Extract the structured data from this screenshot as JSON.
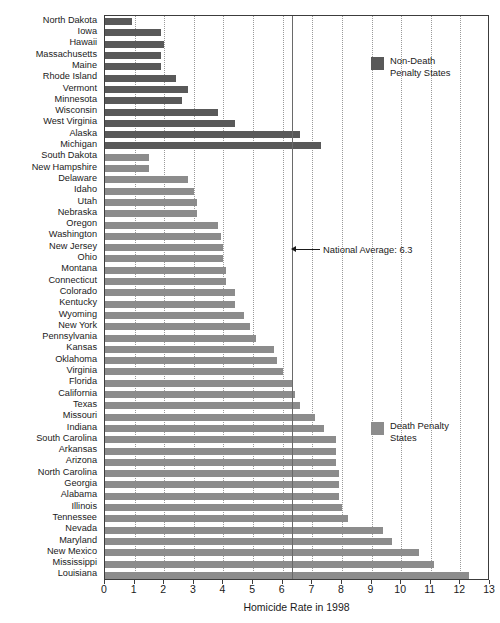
{
  "chart_data": {
    "type": "bar",
    "orientation": "horizontal",
    "title": "",
    "xlabel": "Homicide Rate in 1998",
    "ylabel": "",
    "xlim": [
      0,
      13
    ],
    "xticks": [
      0,
      1,
      2,
      3,
      4,
      5,
      6,
      7,
      8,
      9,
      10,
      11,
      12,
      13
    ],
    "xtick_labels": [
      "0",
      "1",
      "2",
      "3",
      "4",
      "5",
      "6",
      "7",
      "8",
      "9",
      "10",
      "11",
      "12",
      "13"
    ],
    "grid": "vertical-dotted",
    "legend_position": "inside-right",
    "series": [
      {
        "name": "Non-Death Penalty States",
        "color": "#595959"
      },
      {
        "name": "Death Penalty States",
        "color": "#8c8c8c"
      }
    ],
    "annotations": [
      {
        "label": "National Average: 6.3",
        "value": 6.3,
        "style": "vertical-line-with-left-arrow"
      }
    ],
    "categories": [
      "North Dakota",
      "Iowa",
      "Hawaii",
      "Massachusetts",
      "Maine",
      "Rhode Island",
      "Vermont",
      "Minnesota",
      "Wisconsin",
      "West Virginia",
      "Alaska",
      "Michigan",
      "South Dakota",
      "New Hampshire",
      "Delaware",
      "Idaho",
      "Utah",
      "Nebraska",
      "Oregon",
      "Washington",
      "New Jersey",
      "Ohio",
      "Montana",
      "Connecticut",
      "Colorado",
      "Kentucky",
      "Wyoming",
      "New York",
      "Pennsylvania",
      "Kansas",
      "Oklahoma",
      "Virginia",
      "Florida",
      "California",
      "Texas",
      "Missouri",
      "Indiana",
      "South Carolina",
      "Arkansas",
      "Arizona",
      "North Carolina",
      "Georgia",
      "Alabama",
      "Illinois",
      "Tennessee",
      "Nevada",
      "Maryland",
      "New Mexico",
      "Mississippi",
      "Louisiana"
    ],
    "values": [
      0.9,
      1.9,
      2.0,
      1.9,
      1.9,
      2.4,
      2.8,
      2.6,
      3.8,
      4.4,
      6.6,
      7.3,
      1.5,
      1.5,
      2.8,
      3.0,
      3.1,
      3.1,
      3.8,
      3.9,
      4.0,
      4.0,
      4.1,
      4.1,
      4.4,
      4.4,
      4.7,
      4.9,
      5.1,
      5.7,
      5.8,
      6.0,
      6.3,
      6.4,
      6.6,
      7.1,
      7.4,
      7.8,
      7.8,
      7.8,
      7.9,
      7.9,
      7.9,
      8.0,
      8.2,
      9.4,
      9.7,
      10.6,
      11.1,
      12.3
    ],
    "group_of": [
      "nondeath",
      "nondeath",
      "nondeath",
      "nondeath",
      "nondeath",
      "nondeath",
      "nondeath",
      "nondeath",
      "nondeath",
      "nondeath",
      "nondeath",
      "nondeath",
      "death",
      "death",
      "death",
      "death",
      "death",
      "death",
      "death",
      "death",
      "death",
      "death",
      "death",
      "death",
      "death",
      "death",
      "death",
      "death",
      "death",
      "death",
      "death",
      "death",
      "death",
      "death",
      "death",
      "death",
      "death",
      "death",
      "death",
      "death",
      "death",
      "death",
      "death",
      "death",
      "death",
      "death",
      "death",
      "death",
      "death",
      "death"
    ]
  },
  "legend": {
    "nondeath": {
      "line1": "Non-Death",
      "line2": "Penalty States",
      "color": "#595959"
    },
    "death": {
      "line1": "Death Penalty",
      "line2": "States",
      "color": "#8c8c8c"
    }
  },
  "annotation": {
    "national_average": "National Average: 6.3"
  },
  "axis": {
    "x_title": "Homicide Rate in 1998"
  }
}
